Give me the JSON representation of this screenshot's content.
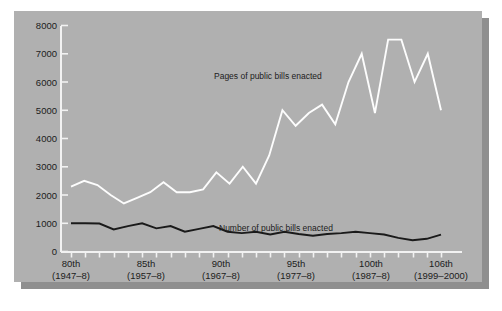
{
  "chart_data": {
    "type": "line",
    "title": "",
    "subtitle": "",
    "xlabel": "",
    "ylabel": "",
    "ylim": [
      0,
      8000
    ],
    "grid": false,
    "legend_position": "inline-annotation",
    "y_ticks": [
      "0",
      "1000",
      "2000",
      "3000",
      "4000",
      "5000",
      "6000",
      "7000",
      "8000"
    ],
    "y_tick_values": [
      0,
      1000,
      2000,
      3000,
      4000,
      5000,
      6000,
      7000,
      8000
    ],
    "x_tick_labels": [
      {
        "congress": "80th",
        "years": "(1947–8)"
      },
      {
        "congress": "85th",
        "years": "(1957–8)"
      },
      {
        "congress": "90th",
        "years": "(1967–8)"
      },
      {
        "congress": "95th",
        "years": "(1977–8)"
      },
      {
        "congress": "100th",
        "years": "(1987–8)"
      },
      {
        "congress": "106th",
        "years": "(1999–2000)"
      }
    ],
    "x_categories": [
      "80th",
      "81st",
      "82nd",
      "83rd",
      "84th",
      "85th",
      "86th",
      "87th",
      "88th",
      "89th",
      "90th",
      "91st",
      "92nd",
      "93rd",
      "94th",
      "95th",
      "96th",
      "97th",
      "98th",
      "99th",
      "100th",
      "101st",
      "102nd",
      "103rd",
      "104th",
      "105th",
      "106th"
    ],
    "series": [
      {
        "name": "Pages of public bills enacted",
        "color": "#fdfdfd",
        "values": [
          2300,
          2500,
          2350,
          2000,
          1700,
          1900,
          2100,
          2450,
          2100,
          2100,
          2200,
          2800,
          2400,
          3000,
          2400,
          3400,
          5000,
          4450,
          4900,
          5200,
          4500,
          6000,
          7000,
          4900,
          7500,
          7500,
          6000,
          7000,
          5000
        ]
      },
      {
        "name": "Number of public bills enacted",
        "color": "#1a1a1a",
        "values": [
          1000,
          1000,
          990,
          780,
          900,
          1000,
          820,
          900,
          700,
          800,
          900,
          700,
          650,
          700,
          600,
          700,
          620,
          560,
          620,
          650,
          700,
          650,
          600,
          480,
          400,
          450,
          600
        ]
      }
    ],
    "annotations": [
      {
        "text": "Pages of public bills enacted",
        "x": 200,
        "y": 68
      },
      {
        "text": "Number of public bills enacted",
        "x": 205,
        "y": 220
      }
    ]
  },
  "colors": {
    "page_background": "#ffffff",
    "panel_background": "#b0b0b0",
    "panel_shadow": "#8f8f8f",
    "axis": "#f2f2f2",
    "light_series": "#fdfdfd",
    "dark_series": "#1a1a1a",
    "text": "#1c1c1c"
  }
}
